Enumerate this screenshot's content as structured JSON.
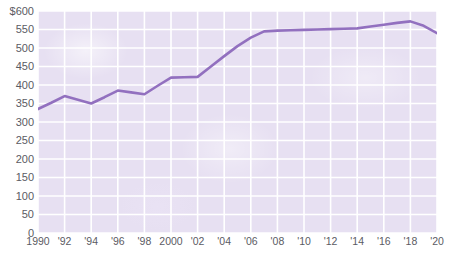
{
  "chart_data": {
    "type": "line",
    "title": "",
    "xlabel": "",
    "ylabel": "",
    "currency_prefix": "$",
    "ylim": [
      0,
      600
    ],
    "xlim": [
      1990,
      2020
    ],
    "grid": true,
    "legend": "none",
    "y_ticks": [
      0,
      50,
      100,
      150,
      200,
      250,
      300,
      350,
      400,
      450,
      500,
      550,
      600
    ],
    "y_tick_labels": [
      "0",
      "50",
      "100",
      "150",
      "200",
      "250",
      "300",
      "350",
      "400",
      "450",
      "500",
      "550",
      "$600"
    ],
    "x_ticks": [
      1990,
      1992,
      1994,
      1996,
      1998,
      2000,
      2002,
      2004,
      2006,
      2008,
      2010,
      2012,
      2014,
      2016,
      2018,
      2020
    ],
    "x_tick_labels": [
      "1990",
      "'92",
      "'94",
      "'96",
      "'98",
      "2000",
      "'02",
      "'04",
      "'06",
      "'08",
      "'10",
      "'12",
      "'14",
      "'16",
      "'18",
      "'20"
    ],
    "series": [
      {
        "name": "value",
        "color": "#9270bf",
        "x": [
          1990,
          1991,
          1992,
          1993,
          1994,
          1995,
          1996,
          1997,
          1998,
          1999,
          2000,
          2001,
          2002,
          2003,
          2004,
          2005,
          2006,
          2007,
          2008,
          2009,
          2010,
          2011,
          2012,
          2013,
          2014,
          2015,
          2016,
          2017,
          2018,
          2019,
          2020
        ],
        "values": [
          335,
          352,
          370,
          360,
          350,
          367,
          385,
          380,
          375,
          398,
          420,
          421,
          422,
          450,
          478,
          505,
          528,
          545,
          547,
          548,
          549,
          550,
          551,
          552,
          553,
          558,
          563,
          568,
          572,
          560,
          540
        ]
      }
    ],
    "colors": {
      "line": "#9270bf",
      "plot_background": "#e7e0f2",
      "gridline": "#ffffff",
      "tick_label": "#5b5b63",
      "page_background": "#ffffff"
    }
  }
}
